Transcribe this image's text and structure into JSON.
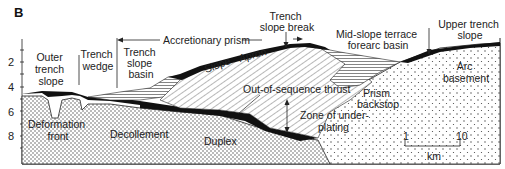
{
  "panel_label": "B",
  "depth_axis": {
    "ticks": [
      "2",
      "4",
      "6",
      "8"
    ],
    "unit": "km"
  },
  "zones": {
    "outer_trench_slope": [
      "Outer",
      "trench",
      "slope"
    ],
    "trench_wedge": [
      "Trench",
      "wedge"
    ],
    "trench_slope_basin": [
      "Trench",
      "slope",
      "basin"
    ],
    "accretionary_prism": "Accretionary prism",
    "trench_slope_break": [
      "Trench",
      "slope break"
    ],
    "mid_slope_terrace": [
      "Mid-slope terrace",
      "forearc basin"
    ],
    "upper_trench_slope": [
      "Upper trench",
      "slope"
    ]
  },
  "features": {
    "slope": "Slope",
    "apron": "Apron",
    "out_of_sequence_thrust": "Out-of-sequence thrust",
    "zone_of_underplating": [
      "Zone of under-",
      "plating"
    ],
    "prism_backstop": [
      "Prism",
      "backstop"
    ],
    "arc_basement": [
      "Arc",
      "basement"
    ],
    "deformation_front": [
      "Deformation",
      "front"
    ],
    "decollement": "Decollement",
    "duplex": "Duplex"
  },
  "scale_bar": {
    "left_label": "1",
    "right_label": "10",
    "unit": "km"
  },
  "colors": {
    "ink": "#111111",
    "paper": "#ffffff",
    "stipple": "#555555"
  }
}
